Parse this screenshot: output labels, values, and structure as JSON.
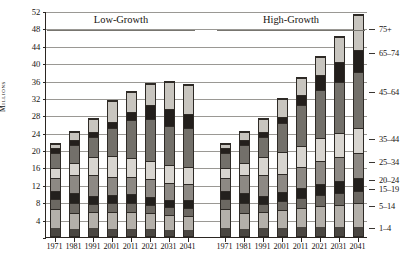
{
  "chart_data": {
    "type": "bar",
    "stacked": true,
    "title": "",
    "xlabel": "",
    "ylabel": "Millions",
    "ylim": [
      0,
      52
    ],
    "ytick_step": 4,
    "yticks": [
      0,
      4,
      8,
      12,
      16,
      20,
      24,
      28,
      32,
      36,
      40,
      44,
      48,
      52
    ],
    "grid": true,
    "legend_position": "right",
    "panels": [
      {
        "name": "Low-Growth",
        "categories": [
          "1971",
          "1981",
          "1991",
          "2001",
          "2011",
          "2021",
          "2031",
          "2041"
        ],
        "totals": [
          21.6,
          24.3,
          27.4,
          31.6,
          33.6,
          35.5,
          35.8,
          35.3
        ]
      },
      {
        "name": "High-Growth",
        "categories": [
          "1971",
          "1981",
          "1991",
          "2001",
          "2011",
          "2021",
          "2031",
          "2041"
        ],
        "totals": [
          21.6,
          24.3,
          27.4,
          31.9,
          36.9,
          41.6,
          46.2,
          51.4
        ]
      }
    ],
    "series": [
      {
        "name": "1-4",
        "color": "#4a4641",
        "values_low": [
          2.0,
          1.7,
          1.8,
          1.6,
          1.6,
          1.6,
          1.4,
          1.3
        ],
        "values_high": [
          2.0,
          1.7,
          1.8,
          1.8,
          2.0,
          2.1,
          2.1,
          2.2
        ]
      },
      {
        "name": "5-14",
        "color": "#b4b0aa",
        "values_low": [
          4.3,
          3.7,
          3.8,
          4.0,
          3.9,
          3.7,
          3.5,
          3.4
        ],
        "values_high": [
          4.3,
          3.7,
          3.8,
          4.2,
          4.6,
          5.0,
          5.2,
          5.5
        ]
      },
      {
        "name": "15-19",
        "color": "#6c6862",
        "values_low": [
          2.3,
          2.3,
          1.9,
          2.0,
          2.1,
          1.9,
          1.8,
          1.8
        ],
        "values_high": [
          2.3,
          2.3,
          1.9,
          2.1,
          2.3,
          2.5,
          2.7,
          2.8
        ]
      },
      {
        "name": "20-24",
        "color": "#23201d",
        "values_low": [
          2.1,
          2.3,
          1.9,
          2.0,
          2.1,
          2.0,
          1.8,
          1.8
        ],
        "values_high": [
          2.1,
          2.3,
          1.9,
          2.1,
          2.4,
          2.6,
          2.8,
          2.9
        ]
      },
      {
        "name": "25-34",
        "color": "#8d8984",
        "values_low": [
          2.9,
          4.3,
          4.9,
          4.1,
          4.1,
          4.2,
          3.9,
          3.8
        ],
        "values_high": [
          2.9,
          4.3,
          4.9,
          4.3,
          4.8,
          5.3,
          5.6,
          5.9
        ]
      },
      {
        "name": "35-44",
        "color": "#d8d5d0",
        "values_low": [
          2.4,
          2.8,
          4.2,
          5.0,
          4.3,
          4.2,
          4.1,
          4.0
        ],
        "values_high": [
          2.4,
          2.8,
          4.2,
          5.1,
          4.9,
          5.2,
          5.5,
          5.8
        ]
      },
      {
        "name": "45-64",
        "color": "#73706a",
        "values_low": [
          3.6,
          4.2,
          4.6,
          6.6,
          8.9,
          9.7,
          9.1,
          9.0
        ],
        "values_high": [
          3.6,
          4.2,
          4.6,
          6.7,
          9.6,
          11.3,
          12.0,
          13.0
        ]
      },
      {
        "name": "65-74",
        "color": "#231f1c",
        "values_low": [
          1.0,
          1.2,
          1.3,
          1.4,
          2.0,
          3.2,
          3.9,
          3.4
        ],
        "values_high": [
          1.0,
          1.2,
          1.3,
          1.4,
          2.2,
          3.5,
          4.5,
          5.0
        ]
      },
      {
        "name": "75+",
        "color": "#c8c5bf",
        "values_low": [
          1.0,
          1.8,
          3.0,
          4.9,
          4.6,
          5.0,
          6.3,
          6.8
        ],
        "values_high": [
          1.0,
          1.8,
          3.0,
          4.2,
          4.1,
          4.1,
          5.8,
          8.3
        ]
      }
    ],
    "legend_entries": [
      {
        "label": "75+",
        "y_value": 48.0
      },
      {
        "label": "65-74",
        "y_value": 42.5
      },
      {
        "label": "45-64",
        "y_value": 33.5
      },
      {
        "label": "35-44",
        "y_value": 22.8
      },
      {
        "label": "25-34",
        "y_value": 17.6
      },
      {
        "label": "20-24",
        "y_value": 13.4
      },
      {
        "label": "15-19",
        "y_value": 11.2
      },
      {
        "label": "5-14",
        "y_value": 7.3
      },
      {
        "label": "1-4",
        "y_value": 2.3
      }
    ]
  },
  "axis": {
    "ylabel": "Millions"
  }
}
